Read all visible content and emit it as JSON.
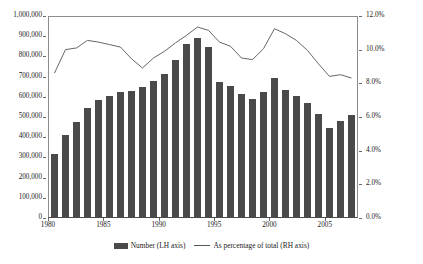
{
  "chart_data": {
    "type": "bar",
    "title": "",
    "xlabel": "",
    "ylabel": "",
    "grid": false,
    "legend_position": "bottom",
    "x": [
      1980,
      1981,
      1982,
      1983,
      1984,
      1985,
      1986,
      1987,
      1988,
      1989,
      1990,
      1991,
      1992,
      1993,
      1994,
      1995,
      1996,
      1997,
      1998,
      1999,
      2000,
      2001,
      2002,
      2003,
      2004,
      2005,
      2006,
      2007
    ],
    "categories": [
      "1980",
      "1981",
      "1982",
      "1983",
      "1984",
      "1985",
      "1986",
      "1987",
      "1988",
      "1989",
      "1990",
      "1991",
      "1992",
      "1993",
      "1994",
      "1995",
      "1996",
      "1997",
      "1998",
      "1999",
      "2000",
      "2001",
      "2002",
      "2003",
      "2004",
      "2005",
      "2006",
      "2007"
    ],
    "xtick_labels": [
      "1980",
      "1985",
      "1990",
      "1995",
      "2000",
      "2005"
    ],
    "xtick_values": [
      1980,
      1985,
      1990,
      1995,
      2000,
      2005
    ],
    "left_axis": {
      "label": "",
      "ylim": [
        0,
        1000000
      ],
      "tick_values": [
        0,
        100000,
        200000,
        300000,
        400000,
        500000,
        600000,
        700000,
        800000,
        900000,
        1000000
      ],
      "tick_labels": [
        "0",
        "100,000",
        "200,000",
        "300,000",
        "400,000",
        "500,000",
        "600,000",
        "700,000",
        "800,000",
        "900,000",
        "1,000,000"
      ]
    },
    "right_axis": {
      "label": "",
      "ylim": [
        0,
        12
      ],
      "tick_values": [
        0,
        2,
        4,
        6,
        8,
        10,
        12
      ],
      "tick_labels": [
        "0.0%",
        "2.0%",
        "4.0%",
        "6.0%",
        "8.0%",
        "10.0%",
        "12.0%"
      ]
    },
    "series": [
      {
        "name": "Number (LH axis)",
        "type": "bar",
        "axis": "left",
        "color": "#4a4a4a",
        "values": [
          310000,
          408000,
          468000,
          538000,
          578000,
          600000,
          621000,
          626000,
          642000,
          673000,
          710000,
          777000,
          858000,
          884000,
          841000,
          670000,
          650000,
          610000,
          585000,
          617000,
          689000,
          631000,
          601000,
          562000,
          511000,
          439000,
          473000,
          506000
        ]
      },
      {
        "name": "As percentage of total (RH axis)",
        "type": "line",
        "axis": "right",
        "color": "#555555",
        "values": [
          8.65,
          10.05,
          10.15,
          10.6,
          10.5,
          10.35,
          10.2,
          9.5,
          8.95,
          9.55,
          9.95,
          10.45,
          10.9,
          11.4,
          11.2,
          10.5,
          10.25,
          9.55,
          9.45,
          10.1,
          11.3,
          11.0,
          10.6,
          10.0,
          9.2,
          8.45,
          8.55,
          8.35
        ]
      }
    ]
  },
  "legend": {
    "entries": [
      {
        "label": "Number (LH axis)",
        "marker": "bar-swatch"
      },
      {
        "label": "As percentage of total (RH axis)",
        "marker": "line-swatch"
      }
    ]
  },
  "colors": {
    "bar": "#4a4a4a",
    "line": "#555555",
    "axis": "#8d8d8d",
    "text": "#1a1a1a",
    "background": "#ffffff"
  }
}
